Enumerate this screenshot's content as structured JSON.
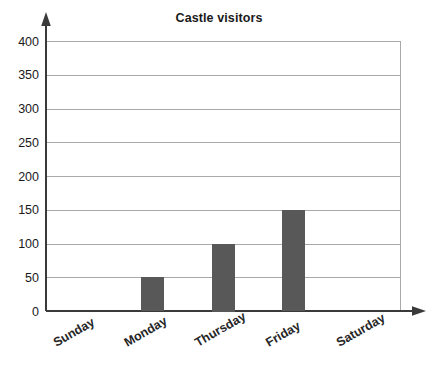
{
  "chart_data": {
    "type": "bar",
    "title": "Castle visitors",
    "xlabel": "",
    "ylabel": "",
    "categories": [
      "Sunday",
      "Monday",
      "Thursday",
      "Friday",
      "Saturday"
    ],
    "values": [
      0,
      50,
      100,
      150,
      0
    ],
    "series": [
      {
        "name": "Castle visitors",
        "values": [
          0,
          50,
          100,
          150,
          0
        ]
      }
    ],
    "ylim": [
      0,
      400
    ],
    "xlim_categories": 5,
    "ytick_values": [
      0,
      50,
      100,
      150,
      200,
      250,
      300,
      350,
      400
    ],
    "ytick_labels": [
      "0",
      "50",
      "100",
      "150",
      "200",
      "250",
      "300",
      "350",
      "400"
    ],
    "ytick_step": 50,
    "grid": {
      "horizontal": true,
      "vertical": false
    },
    "legend": {
      "visible": false,
      "position": "none"
    },
    "annotations": [],
    "axis_style": {
      "y_axis_arrow": true,
      "x_axis_arrow": true,
      "x_tick_labels_rotated_deg": -30
    },
    "colors": {
      "bar_fill": "#585858",
      "gridline": "#a9a9a9",
      "axis": "#3a3a3a",
      "text": "#1a1a1a",
      "background": "#ffffff"
    }
  }
}
